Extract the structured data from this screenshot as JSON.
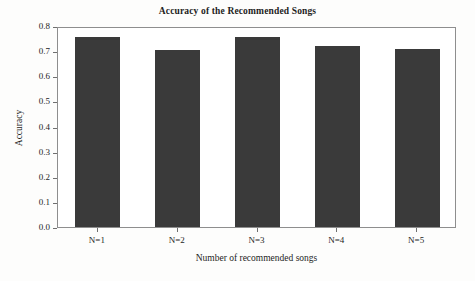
{
  "chart_data": {
    "type": "bar",
    "title": "Accuracy of the Recommended Songs",
    "xlabel": "Number of recommended songs",
    "ylabel": "Accuracy",
    "categories": [
      "N=1",
      "N=2",
      "N=3",
      "N=4",
      "N=5"
    ],
    "values": [
      0.755,
      0.705,
      0.757,
      0.721,
      0.709
    ],
    "ylim": [
      0.0,
      0.8
    ],
    "ytick_labels": [
      "0.0",
      "0.1",
      "0.2",
      "0.3",
      "0.4",
      "0.5",
      "0.6",
      "0.7",
      "0.8"
    ],
    "ytick_values": [
      0.0,
      0.1,
      0.2,
      0.3,
      0.4,
      0.5,
      0.6,
      0.7,
      0.8
    ],
    "grid": false,
    "legend": "none",
    "bar_color": "#3a3a3a",
    "frame_color": "#8e8e8e",
    "background_color": "#ffffff"
  }
}
